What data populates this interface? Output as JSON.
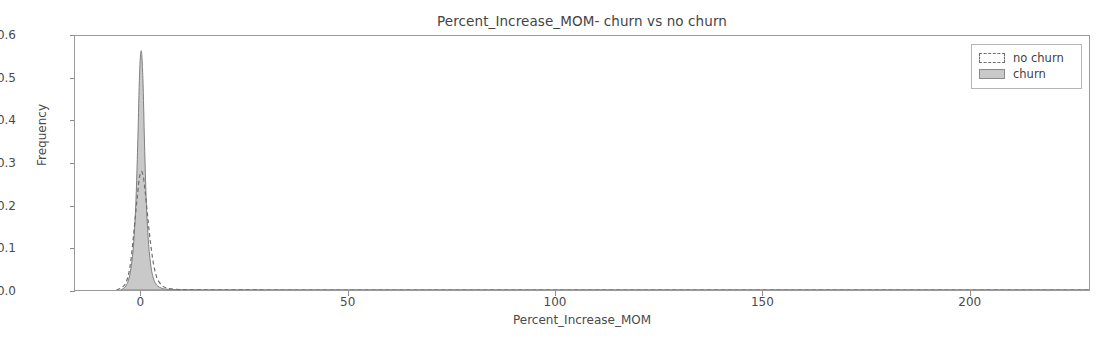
{
  "chart_data": {
    "type": "area",
    "title": "Percent_Increase_MOM- churn vs no churn",
    "xlabel": "Percent_Increase_MOM",
    "ylabel": "Frequency",
    "xlim": [
      -16,
      229
    ],
    "ylim": [
      0.0,
      0.6
    ],
    "xticks": [
      0,
      50,
      100,
      150,
      200
    ],
    "xtick_labels": [
      "0",
      "50",
      "100",
      "150",
      "200"
    ],
    "yticks": [
      0.0,
      0.1,
      0.2,
      0.3,
      0.4,
      0.5,
      0.6
    ],
    "ytick_labels": [
      "0.0",
      "0.1",
      "0.2",
      "0.3",
      "0.4",
      "0.5",
      "0.6"
    ],
    "grid": false,
    "legend_position": "upper right",
    "legend_entries": [
      "no churn",
      "churn"
    ],
    "series": [
      {
        "name": "no churn",
        "style": "dashed-outline",
        "peak_x": 0,
        "peak_y": 0.28,
        "x": [
          -6,
          -5,
          -4,
          -3.5,
          -3,
          -2.5,
          -2,
          -1.5,
          -1,
          -0.5,
          0,
          0.5,
          1,
          1.5,
          2,
          2.5,
          3,
          3.5,
          4,
          5,
          6,
          8,
          10,
          14,
          20,
          40,
          80,
          140,
          200,
          229
        ],
        "values": [
          0.0,
          0.004,
          0.012,
          0.022,
          0.04,
          0.07,
          0.115,
          0.165,
          0.215,
          0.262,
          0.28,
          0.268,
          0.228,
          0.18,
          0.132,
          0.092,
          0.06,
          0.038,
          0.024,
          0.011,
          0.005,
          0.002,
          0.001,
          0.0005,
          0.0002,
          0.0,
          0.0,
          0.0,
          0.0,
          0.0
        ]
      },
      {
        "name": "churn",
        "style": "filled-gray",
        "peak_x": 0,
        "peak_y": 0.565,
        "x": [
          -5,
          -4,
          -3.5,
          -3,
          -2.5,
          -2,
          -1.6,
          -1.2,
          -0.8,
          -0.4,
          0,
          0.4,
          0.8,
          1.2,
          1.6,
          2,
          2.5,
          3,
          3.5,
          4,
          5,
          6,
          8,
          10,
          14,
          20,
          40,
          80,
          140,
          200,
          229
        ],
        "values": [
          0.0,
          0.006,
          0.013,
          0.026,
          0.05,
          0.09,
          0.145,
          0.23,
          0.36,
          0.51,
          0.565,
          0.5,
          0.345,
          0.215,
          0.135,
          0.085,
          0.046,
          0.026,
          0.015,
          0.009,
          0.004,
          0.002,
          0.001,
          0.0005,
          0.0002,
          0.0,
          0.0,
          0.0,
          0.0,
          0.0,
          0.0
        ]
      }
    ]
  },
  "colors": {
    "churn_fill": "#c9c9c9",
    "churn_edge": "#7e7e7e",
    "nochurn_edge": "#6e6e6e",
    "axis": "#9a9a9a",
    "text": "#444444"
  }
}
